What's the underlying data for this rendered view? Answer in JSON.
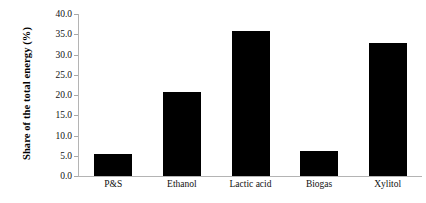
{
  "chart_data": {
    "type": "bar",
    "title": "",
    "xlabel": "",
    "ylabel": "Share of the total energy (%)",
    "categories": [
      "P&S",
      "Ethanol",
      "Lactic acid",
      "Biogas",
      "Xylitol"
    ],
    "values": [
      5.4,
      20.7,
      35.8,
      6.2,
      32.8
    ],
    "ylim": [
      0.0,
      40.0
    ],
    "ytick_step": 5.0,
    "yticks": [
      "0.0",
      "5.0",
      "10.0",
      "15.0",
      "20.0",
      "25.0",
      "30.0",
      "35.0",
      "40.0"
    ],
    "ytick_values": [
      0.0,
      5.0,
      10.0,
      15.0,
      20.0,
      25.0,
      30.0,
      35.0,
      40.0
    ],
    "grid": false,
    "legend": false,
    "series": [
      {
        "name": "Share of the total energy (%)",
        "color": "#000000",
        "values": [
          5.4,
          20.7,
          35.8,
          6.2,
          32.8
        ]
      }
    ],
    "axis_color": "#b4b4b4",
    "bar_color": "#000000",
    "background": "#ffffff"
  }
}
